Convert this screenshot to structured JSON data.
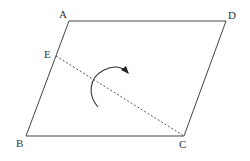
{
  "diagram": {
    "type": "parallelogram-fold",
    "vertices": {
      "A": {
        "label": "A",
        "x": 69,
        "y": 21
      },
      "D": {
        "label": "D",
        "x": 226,
        "y": 21
      },
      "B": {
        "label": "B",
        "x": 26,
        "y": 136
      },
      "C": {
        "label": "C",
        "x": 184,
        "y": 136
      },
      "E": {
        "label": "E",
        "x": 56,
        "y": 56
      }
    },
    "edges": [
      {
        "from": "A",
        "to": "D",
        "style": "solid"
      },
      {
        "from": "D",
        "to": "C",
        "style": "solid"
      },
      {
        "from": "C",
        "to": "B",
        "style": "solid"
      },
      {
        "from": "B",
        "to": "A",
        "style": "solid"
      },
      {
        "from": "E",
        "to": "C",
        "style": "dashed"
      }
    ],
    "annotations": [
      {
        "type": "curved-arrow",
        "description": "fold direction across EC"
      }
    ],
    "line_color": "#444444"
  }
}
